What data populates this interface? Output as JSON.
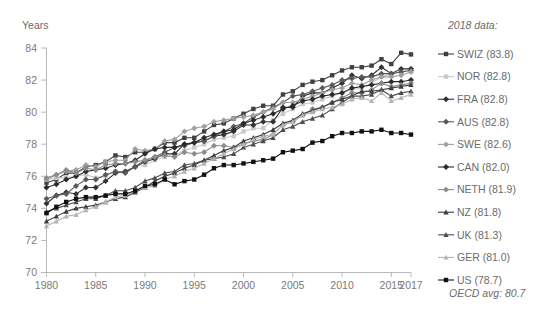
{
  "chart_data": {
    "type": "line",
    "title": "",
    "xlabel": "",
    "ylabel": "Years",
    "ylim": [
      70,
      84
    ],
    "yticks": [
      70,
      72,
      74,
      76,
      78,
      80,
      82,
      84
    ],
    "xlim": [
      1980,
      2017
    ],
    "xticks": [
      1980,
      1985,
      1990,
      1995,
      2000,
      2005,
      2010,
      2015,
      2017
    ],
    "grid": false,
    "legend_position": "right",
    "legend_title": "2018 data:",
    "legend_footnote": "OECD avg: 80.7",
    "x": [
      1980,
      1981,
      1982,
      1983,
      1984,
      1985,
      1986,
      1987,
      1988,
      1989,
      1990,
      1991,
      1992,
      1993,
      1994,
      1995,
      1996,
      1997,
      1998,
      1999,
      2000,
      2001,
      2002,
      2003,
      2004,
      2005,
      2006,
      2007,
      2008,
      2009,
      2010,
      2011,
      2012,
      2013,
      2014,
      2015,
      2016,
      2017
    ],
    "series": [
      {
        "name": "SWIZ",
        "label": "SWIZ (83.8)",
        "value_2018": 83.8,
        "color": "#404040",
        "marker": "square",
        "values": [
          75.6,
          75.8,
          76.2,
          76.2,
          76.6,
          76.7,
          76.9,
          77.3,
          77.2,
          77.5,
          77.5,
          77.7,
          78.1,
          78.1,
          78.4,
          78.4,
          78.8,
          79.2,
          79.3,
          79.6,
          79.9,
          80.2,
          80.4,
          80.4,
          81.1,
          81.3,
          81.7,
          81.9,
          82.0,
          82.3,
          82.6,
          82.8,
          82.8,
          82.9,
          83.3,
          83.0,
          83.7,
          83.6
        ]
      },
      {
        "name": "NOR",
        "label": "NOR (82.8)",
        "value_2018": 82.8,
        "color": "#c9c9c9",
        "marker": "square",
        "values": [
          75.8,
          75.9,
          75.9,
          76.0,
          76.1,
          75.9,
          76.0,
          76.3,
          76.3,
          76.6,
          76.7,
          77.0,
          77.2,
          77.3,
          77.6,
          77.8,
          78.0,
          78.3,
          78.4,
          78.5,
          78.8,
          79.0,
          79.0,
          79.5,
          79.9,
          80.2,
          80.5,
          80.6,
          80.8,
          81.0,
          81.2,
          81.4,
          81.5,
          81.8,
          82.2,
          82.4,
          82.5,
          82.7
        ]
      },
      {
        "name": "FRA",
        "label": "FRA (82.8)",
        "value_2018": 82.8,
        "color": "#333333",
        "marker": "diamond",
        "values": [
          74.3,
          74.8,
          75.0,
          74.9,
          75.3,
          75.3,
          75.7,
          76.2,
          76.3,
          76.6,
          76.9,
          77.1,
          77.4,
          77.4,
          78.0,
          78.1,
          78.2,
          78.5,
          78.6,
          78.8,
          79.2,
          79.2,
          79.4,
          79.4,
          80.3,
          80.3,
          81.0,
          81.2,
          81.2,
          81.5,
          81.8,
          82.3,
          82.1,
          82.3,
          82.8,
          82.4,
          82.7,
          82.7
        ]
      },
      {
        "name": "AUS",
        "label": "AUS (82.8)",
        "value_2018": 82.8,
        "color": "#595959",
        "marker": "diamond",
        "values": [
          74.6,
          74.8,
          74.9,
          75.4,
          75.8,
          75.8,
          76.1,
          76.3,
          76.2,
          76.6,
          77.0,
          77.2,
          77.5,
          77.8,
          77.9,
          78.1,
          78.2,
          78.5,
          78.8,
          79.1,
          79.3,
          79.7,
          80.0,
          80.3,
          80.6,
          81.0,
          81.1,
          81.3,
          81.5,
          81.7,
          82.0,
          82.1,
          82.2,
          82.2,
          82.4,
          82.4,
          82.5,
          82.6
        ]
      },
      {
        "name": "SWE",
        "label": "SWE (82.6)",
        "value_2018": 82.6,
        "color": "#a0a0a0",
        "marker": "diamond",
        "values": [
          75.8,
          76.1,
          76.3,
          76.4,
          76.7,
          76.6,
          76.9,
          77.0,
          77.0,
          77.7,
          77.6,
          77.7,
          78.2,
          78.3,
          78.8,
          79.0,
          79.1,
          79.4,
          79.5,
          79.6,
          79.7,
          79.8,
          80.0,
          80.2,
          80.6,
          80.6,
          80.8,
          81.0,
          81.2,
          81.4,
          81.5,
          81.8,
          81.7,
          82.0,
          82.2,
          82.2,
          82.3,
          82.5
        ]
      },
      {
        "name": "CAN",
        "label": "CAN (82.0)",
        "value_2018": 82.0,
        "color": "#2b2b2b",
        "marker": "diamond",
        "values": [
          75.3,
          75.5,
          75.8,
          76.0,
          76.3,
          76.4,
          76.5,
          76.7,
          76.8,
          77.0,
          77.4,
          77.7,
          77.8,
          77.8,
          78.0,
          78.1,
          78.4,
          78.6,
          78.8,
          78.9,
          79.3,
          79.5,
          79.7,
          79.9,
          80.2,
          80.4,
          80.7,
          80.8,
          81.0,
          81.1,
          81.2,
          81.5,
          81.6,
          81.7,
          81.8,
          81.9,
          81.9,
          82.0
        ]
      },
      {
        "name": "NETH",
        "label": "NETH (81.9)",
        "value_2018": 81.9,
        "color": "#8c8c8c",
        "marker": "diamond",
        "values": [
          75.9,
          76.1,
          76.4,
          76.2,
          76.5,
          76.4,
          76.7,
          76.8,
          76.8,
          76.9,
          77.0,
          77.2,
          77.3,
          77.2,
          77.5,
          77.4,
          77.5,
          77.9,
          77.9,
          77.8,
          78.0,
          78.2,
          78.3,
          78.6,
          79.2,
          79.4,
          79.8,
          80.2,
          80.3,
          80.6,
          80.9,
          81.2,
          81.2,
          81.4,
          81.8,
          81.6,
          81.7,
          81.8
        ]
      },
      {
        "name": "NZ",
        "label": "NZ (81.8)",
        "value_2018": 81.8,
        "color": "#3d3d3d",
        "marker": "triangle",
        "values": [
          73.2,
          73.5,
          73.8,
          74.0,
          74.1,
          74.2,
          74.4,
          74.6,
          74.7,
          75.0,
          75.3,
          75.7,
          76.0,
          76.2,
          76.5,
          76.7,
          77.0,
          77.3,
          77.6,
          77.8,
          78.2,
          78.4,
          78.6,
          78.9,
          79.3,
          79.5,
          79.9,
          80.1,
          80.3,
          80.6,
          80.8,
          81.0,
          81.3,
          81.3,
          81.4,
          81.5,
          81.6,
          81.7
        ]
      },
      {
        "name": "UK",
        "label": "UK (81.3)",
        "value_2018": 81.3,
        "color": "#4d4d4d",
        "marker": "triangle",
        "values": [
          73.8,
          74.0,
          74.2,
          74.4,
          74.6,
          74.6,
          74.8,
          75.1,
          75.1,
          75.3,
          75.7,
          75.9,
          76.2,
          76.3,
          76.7,
          76.8,
          77.0,
          77.1,
          77.2,
          77.4,
          77.8,
          78.0,
          78.2,
          78.4,
          78.9,
          79.1,
          79.4,
          79.6,
          79.8,
          80.2,
          80.6,
          81.0,
          81.0,
          81.1,
          81.4,
          81.0,
          81.2,
          81.3
        ]
      },
      {
        "name": "GER",
        "label": "GER (81.0)",
        "value_2018": 81.0,
        "color": "#b5b5b5",
        "marker": "triangle",
        "values": [
          72.9,
          73.2,
          73.5,
          73.6,
          73.9,
          74.1,
          74.4,
          74.7,
          74.8,
          75.1,
          75.3,
          75.4,
          75.8,
          76.0,
          76.3,
          76.5,
          76.8,
          77.1,
          77.4,
          77.7,
          78.0,
          78.3,
          78.5,
          78.6,
          79.2,
          79.4,
          79.8,
          80.0,
          80.2,
          80.3,
          80.5,
          80.8,
          80.9,
          80.7,
          81.2,
          80.7,
          80.9,
          81.1
        ]
      },
      {
        "name": "US",
        "label": "US (78.7)",
        "value_2018": 78.7,
        "color": "#111111",
        "marker": "square",
        "values": [
          73.7,
          74.1,
          74.4,
          74.6,
          74.7,
          74.7,
          74.8,
          74.9,
          74.9,
          75.1,
          75.4,
          75.5,
          75.8,
          75.5,
          75.7,
          75.8,
          76.1,
          76.5,
          76.7,
          76.7,
          76.8,
          76.9,
          77.0,
          77.1,
          77.5,
          77.6,
          77.7,
          78.1,
          78.2,
          78.5,
          78.7,
          78.7,
          78.8,
          78.8,
          78.9,
          78.7,
          78.7,
          78.6
        ]
      }
    ]
  },
  "axis": {
    "y_title": "Years",
    "y_tick_labels": [
      "84",
      "82",
      "80",
      "78",
      "76",
      "74",
      "72",
      "70"
    ],
    "x_tick_labels": [
      "1980",
      "1985",
      "1990",
      "1995",
      "2000",
      "2005",
      "2010",
      "2015",
      "2017"
    ]
  },
  "legend": {
    "header": "2018 data:",
    "footnote": "OECD avg: 80.7",
    "items": [
      {
        "label": "SWIZ (83.8)",
        "color": "#404040",
        "marker": "square"
      },
      {
        "label": "NOR (82.8)",
        "color": "#c9c9c9",
        "marker": "square"
      },
      {
        "label": "FRA (82.8)",
        "color": "#333333",
        "marker": "diamond"
      },
      {
        "label": "AUS (82.8)",
        "color": "#595959",
        "marker": "diamond"
      },
      {
        "label": "SWE (82.6)",
        "color": "#a0a0a0",
        "marker": "diamond"
      },
      {
        "label": "CAN (82.0)",
        "color": "#2b2b2b",
        "marker": "diamond"
      },
      {
        "label": "NETH (81.9)",
        "color": "#8c8c8c",
        "marker": "diamond"
      },
      {
        "label": "NZ (81.8)",
        "color": "#3d3d3d",
        "marker": "triangle"
      },
      {
        "label": "UK (81.3)",
        "color": "#4d4d4d",
        "marker": "triangle"
      },
      {
        "label": "GER (81.0)",
        "color": "#b5b5b5",
        "marker": "triangle"
      },
      {
        "label": "US (78.7)",
        "color": "#111111",
        "marker": "square"
      }
    ]
  },
  "colors": {
    "axis": "#b8b8b8",
    "text": "#6b6b6b",
    "background": "#ffffff"
  }
}
